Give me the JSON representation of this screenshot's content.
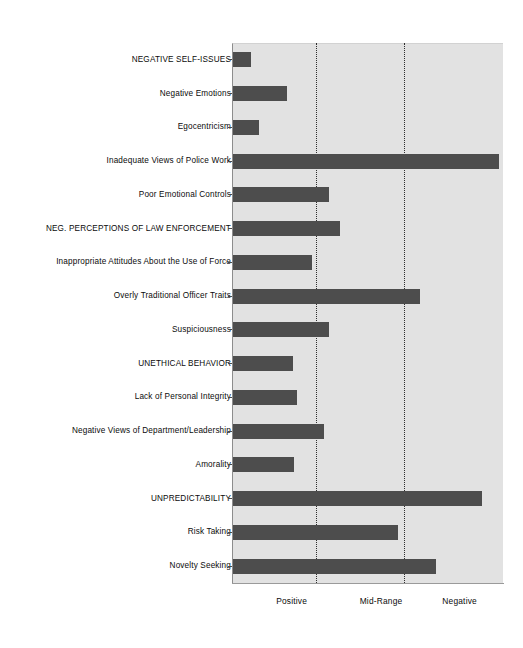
{
  "chart_data": {
    "type": "bar",
    "orientation": "horizontal",
    "title": "",
    "subtitle": "",
    "xlabel": "",
    "ylabel": "",
    "grid": true,
    "gridlines_at": [
      "Mid-Range-left-tick",
      "Mid-Range-right-tick"
    ],
    "legend": "none",
    "xlim": [
      0,
      100
    ],
    "xtick_labels": [
      "Positive",
      "Mid-Range",
      "Negative"
    ],
    "xtick_positions": [
      22,
      55,
      84
    ],
    "bar_color": "#4d4d4d",
    "plot_background": "#e2e2e2",
    "page_background": "#ffffff",
    "categories": [
      "NEGATIVE SELF-ISSUES",
      "Negative Emotions",
      "Egocentricism",
      "Inadequate Views of Police Work",
      "Poor Emotional Controls",
      "NEG. PERCEPTIONS OF LAW ENFORCEMENT",
      "Inappropriate Attitudes About the Use of Force",
      "Overly Traditional Officer Traits",
      "Suspiciousness",
      "UNETHICAL BEHAVIOR",
      "Lack of Personal Integrity",
      "Negative Views of Department/Leadership",
      "Amorality",
      "UNPREDICTABILITY",
      "Risk Taking",
      "Novelty Seeking"
    ],
    "values": [
      6.5,
      20,
      9.5,
      98,
      35.5,
      39.5,
      29,
      69,
      35.5,
      22,
      23.5,
      33.5,
      22.5,
      92,
      61,
      75
    ],
    "values_note": "Bar lengths expressed as percent of the plot width (0 = left axis, 100 = right edge of plot frame)."
  },
  "axis": {
    "tick_labels": [
      {
        "text": "Positive",
        "pos": 22
      },
      {
        "text": "Mid-Range",
        "pos": 55
      },
      {
        "text": "Negative",
        "pos": 84
      }
    ]
  }
}
